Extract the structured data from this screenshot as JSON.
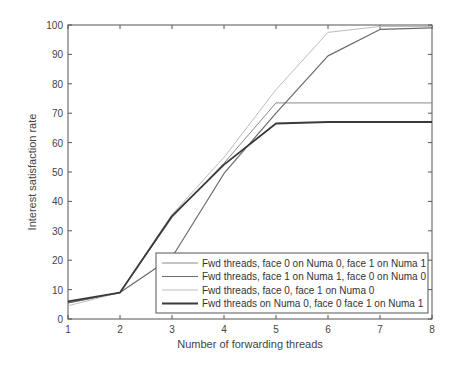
{
  "chart_data": {
    "type": "line",
    "title": "",
    "xlabel": "Number of forwarding threads",
    "ylabel": "Interest satisfaction rate",
    "x": [
      1,
      2,
      3,
      4,
      5,
      6,
      7,
      8
    ],
    "xlim": [
      1,
      8
    ],
    "ylim": [
      0,
      100
    ],
    "xticks": [
      1,
      2,
      3,
      4,
      5,
      6,
      7,
      8
    ],
    "yticks": [
      0,
      10,
      20,
      30,
      40,
      50,
      60,
      70,
      80,
      90,
      100
    ],
    "grid": false,
    "legend_position": "lower right",
    "series": [
      {
        "name": "Fwd threads, face 0 on Numa 0, face 1 on Numa 1",
        "color": "#8a8a8a",
        "width": 1,
        "values": [
          5.5,
          9,
          34.5,
          53,
          73.5,
          73.5,
          73.5,
          73.5
        ]
      },
      {
        "name": "Fwd threads, face 1 on Numa 1, face 0 on Numa 0",
        "color": "#6a6a6a",
        "width": 1.2,
        "values": [
          5.5,
          9,
          21,
          49.5,
          70,
          89.5,
          98.5,
          99
        ]
      },
      {
        "name": "Fwd threads, face 0, face 1 on Numa 0",
        "color": "#bdbdbd",
        "width": 1,
        "values": [
          4.5,
          9,
          35.5,
          55,
          78,
          97.5,
          99.5,
          99.5
        ]
      },
      {
        "name": "Fwd threads on Numa 0, face 0 face 1 on Numa 1",
        "color": "#3a3a3a",
        "width": 1.8,
        "values": [
          6,
          9,
          35,
          52.5,
          66.5,
          67,
          67,
          67
        ]
      }
    ]
  }
}
